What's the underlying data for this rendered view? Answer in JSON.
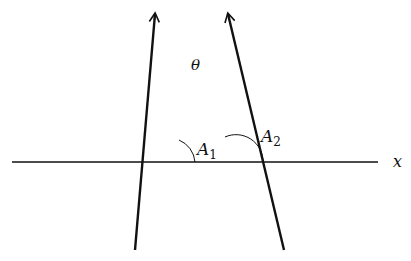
{
  "diagram": {
    "type": "geometry",
    "colors": {
      "stroke": "#111111",
      "background": "#ffffff"
    },
    "labels": {
      "theta": "θ",
      "a1_main": "A",
      "a1_sub": "1",
      "a2_main": "A",
      "a2_sub": "2",
      "x_axis": "x"
    },
    "lines": [
      {
        "name": "x-axis",
        "from": [
          12,
          162
        ],
        "to": [
          378,
          162
        ],
        "arrow": false
      },
      {
        "name": "line-1",
        "from": [
          135,
          250
        ],
        "to": [
          155,
          13
        ],
        "arrow": true
      },
      {
        "name": "line-2",
        "from": [
          284,
          250
        ],
        "to": [
          228,
          13
        ],
        "arrow": true
      }
    ],
    "angles": [
      {
        "name": "theta",
        "vertex": "intersection of line-1 and line-2"
      },
      {
        "name": "A1",
        "vertex": "intersection of line-1 and x-axis"
      },
      {
        "name": "A2",
        "vertex": "intersection of line-2 and x-axis"
      }
    ]
  }
}
